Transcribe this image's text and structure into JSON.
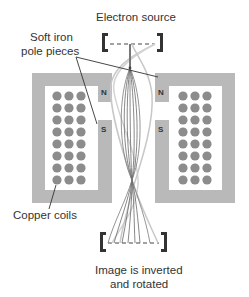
{
  "labels": {
    "electron_source": "Electron source",
    "pole_pieces_line1": "Soft iron",
    "pole_pieces_line2": "pole pieces",
    "copper_coils": "Copper coils",
    "image_line1": "Image is inverted",
    "image_line2": "and rotated"
  },
  "poles": {
    "left_north": "N",
    "left_south": "S",
    "right_north": "N",
    "right_south": "S"
  },
  "coils": {
    "columns": 3,
    "rows": 8
  },
  "colors": {
    "iron": "#b9b9b9",
    "coil": "#8c8c8c",
    "bracket": "#333333",
    "text": "#333333",
    "beam_dark": "#666666",
    "beam_light": "#c8c8c8"
  }
}
